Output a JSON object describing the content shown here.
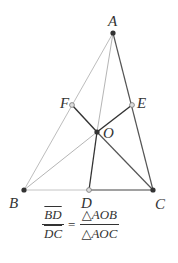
{
  "points": {
    "A": {
      "label": "A",
      "x": 113,
      "y": 33,
      "fill": "#333333"
    },
    "B": {
      "label": "B",
      "x": 24,
      "y": 190,
      "fill": "#333333"
    },
    "C": {
      "label": "C",
      "x": 153,
      "y": 190,
      "fill": "#333333"
    },
    "D": {
      "label": "D",
      "x": 89,
      "y": 190,
      "fill": "#cccccc"
    },
    "E": {
      "label": "E",
      "x": 132,
      "y": 105,
      "fill": "#cccccc"
    },
    "F": {
      "label": "F",
      "x": 72,
      "y": 105,
      "fill": "#cccccc"
    },
    "O": {
      "label": "O",
      "x": 97,
      "y": 132,
      "fill": "#333333"
    }
  },
  "labels": {
    "A": "A",
    "B": "B",
    "C": "C",
    "D": "D",
    "E": "E",
    "F": "F",
    "O": "O"
  },
  "formula": {
    "lhs_num": "BD",
    "lhs_den": "DC",
    "equals": "=",
    "rhs_num": "△AOB",
    "rhs_den": "△AOC"
  },
  "colors": {
    "light_line": "#b5b5b5",
    "dark_line": "#444444",
    "text": "#333333"
  }
}
